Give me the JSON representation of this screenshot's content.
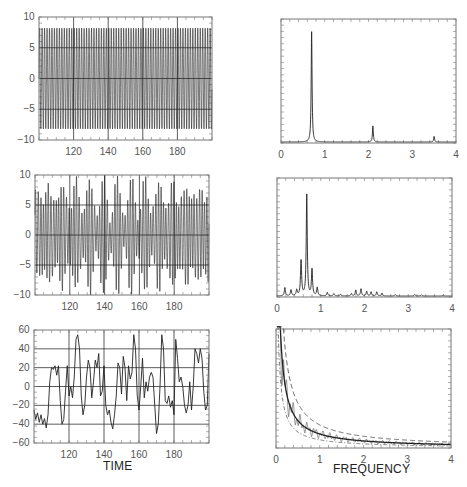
{
  "figure": {
    "xlabel_left": "TIME",
    "xlabel_right": "FREQUENCY",
    "line_color": "#222222",
    "grid_color": "#333333",
    "frame_color": "#777777"
  },
  "chart_data": [
    {
      "id": "ts1",
      "type": "line",
      "title": "",
      "xlabel": "",
      "ylabel": "",
      "box": [
        39,
        17,
        212,
        140
      ],
      "xlim": [
        100,
        200
      ],
      "ylim": [
        -10,
        10
      ],
      "xticks": [
        120,
        140,
        160,
        180
      ],
      "yticks": [
        -10,
        -5,
        0,
        5,
        10
      ],
      "xgrid": [
        120,
        140,
        160,
        180
      ],
      "ygrid": [
        -5,
        0,
        5
      ],
      "signal": {
        "kind": "sine",
        "amplitude": 8.2,
        "freq": 0.7,
        "mod": 0.0
      }
    },
    {
      "id": "spec1",
      "type": "line",
      "title": "",
      "xlabel": "",
      "ylabel": "",
      "box": [
        281,
        19,
        456,
        143
      ],
      "xlim": [
        0,
        4
      ],
      "ylim": [
        0,
        1
      ],
      "xticks": [
        0,
        1,
        2,
        3,
        4
      ],
      "yticks": [],
      "peaks": [
        {
          "f": 0.7,
          "h": 0.89,
          "w": 0.012
        },
        {
          "f": 2.1,
          "h": 0.13,
          "w": 0.012
        },
        {
          "f": 3.5,
          "h": 0.045,
          "w": 0.012
        }
      ]
    },
    {
      "id": "ts2",
      "type": "line",
      "title": "",
      "xlabel": "",
      "ylabel": "",
      "box": [
        35,
        175,
        209,
        295
      ],
      "xlim": [
        100,
        200
      ],
      "ylim": [
        -10,
        10
      ],
      "xticks": [
        120,
        140,
        160,
        180
      ],
      "yticks": [
        -10,
        -5,
        0,
        5,
        10
      ],
      "xgrid": [
        120,
        140,
        160,
        180
      ],
      "ygrid": [
        -5,
        0,
        5
      ],
      "signal": {
        "kind": "multi",
        "amplitude": 9.0
      }
    },
    {
      "id": "spec2",
      "type": "line",
      "title": "",
      "xlabel": "",
      "ylabel": "",
      "box": [
        277,
        178,
        452,
        297
      ],
      "xlim": [
        0,
        4
      ],
      "ylim": [
        0,
        1
      ],
      "xticks": [
        0,
        1,
        2,
        3,
        4
      ],
      "yticks": [],
      "peaks": [
        {
          "f": 0.18,
          "h": 0.07,
          "w": 0.015
        },
        {
          "f": 0.32,
          "h": 0.05,
          "w": 0.015
        },
        {
          "f": 0.45,
          "h": 0.05,
          "w": 0.015
        },
        {
          "f": 0.55,
          "h": 0.3,
          "w": 0.015
        },
        {
          "f": 0.68,
          "h": 0.85,
          "w": 0.014
        },
        {
          "f": 0.8,
          "h": 0.22,
          "w": 0.015
        },
        {
          "f": 0.92,
          "h": 0.07,
          "w": 0.015
        },
        {
          "f": 1.15,
          "h": 0.03,
          "w": 0.015
        },
        {
          "f": 1.3,
          "h": 0.02,
          "w": 0.015
        },
        {
          "f": 1.45,
          "h": 0.015,
          "w": 0.015
        },
        {
          "f": 1.7,
          "h": 0.02,
          "w": 0.015
        },
        {
          "f": 1.8,
          "h": 0.05,
          "w": 0.015
        },
        {
          "f": 1.92,
          "h": 0.06,
          "w": 0.015
        },
        {
          "f": 2.05,
          "h": 0.04,
          "w": 0.015
        },
        {
          "f": 2.15,
          "h": 0.035,
          "w": 0.015
        },
        {
          "f": 2.28,
          "h": 0.035,
          "w": 0.015
        },
        {
          "f": 2.4,
          "h": 0.025,
          "w": 0.015
        },
        {
          "f": 2.7,
          "h": 0.012,
          "w": 0.015
        },
        {
          "f": 3.15,
          "h": 0.012,
          "w": 0.015
        },
        {
          "f": 3.3,
          "h": 0.01,
          "w": 0.015
        },
        {
          "f": 3.8,
          "h": 0.008,
          "w": 0.015
        }
      ]
    },
    {
      "id": "ts3",
      "type": "line",
      "title": "",
      "xlabel": "TIME",
      "ylabel": "",
      "box": [
        34,
        330,
        209,
        443
      ],
      "xlim": [
        100,
        200
      ],
      "ylim": [
        -60,
        60
      ],
      "xticks": [
        120,
        140,
        160,
        180
      ],
      "yticks": [
        -60,
        -40,
        -20,
        0,
        20,
        40,
        60
      ],
      "xgrid": [
        120,
        140,
        160,
        180
      ],
      "ygrid": [
        -40,
        -20,
        0,
        20,
        40
      ],
      "points": [
        [
          100,
          -25
        ],
        [
          101,
          -35
        ],
        [
          102,
          -28
        ],
        [
          103,
          -38
        ],
        [
          104,
          -30
        ],
        [
          105,
          -40
        ],
        [
          106,
          -34
        ],
        [
          107,
          -44
        ],
        [
          108,
          -30
        ],
        [
          109,
          5
        ],
        [
          110,
          20
        ],
        [
          111,
          18
        ],
        [
          112,
          22
        ],
        [
          113,
          12
        ],
        [
          114,
          22
        ],
        [
          115,
          -15
        ],
        [
          116,
          -40
        ],
        [
          117,
          -35
        ],
        [
          118,
          -5
        ],
        [
          119,
          22
        ],
        [
          120,
          -10
        ],
        [
          121,
          0
        ],
        [
          122,
          -12
        ],
        [
          123,
          10
        ],
        [
          124,
          50
        ],
        [
          125,
          55
        ],
        [
          126,
          40
        ],
        [
          127,
          -10
        ],
        [
          128,
          -30
        ],
        [
          129,
          -20
        ],
        [
          130,
          10
        ],
        [
          131,
          28
        ],
        [
          132,
          20
        ],
        [
          133,
          -12
        ],
        [
          134,
          5
        ],
        [
          135,
          28
        ],
        [
          136,
          20
        ],
        [
          137,
          35
        ],
        [
          138,
          -10
        ],
        [
          139,
          -5
        ],
        [
          140,
          22
        ],
        [
          141,
          -20
        ],
        [
          142,
          -30
        ],
        [
          143,
          -25
        ],
        [
          144,
          -38
        ],
        [
          145,
          -45
        ],
        [
          146,
          -30
        ],
        [
          147,
          -10
        ],
        [
          148,
          25
        ],
        [
          149,
          20
        ],
        [
          150,
          -8
        ],
        [
          151,
          32
        ],
        [
          152,
          20
        ],
        [
          153,
          -15
        ],
        [
          154,
          22
        ],
        [
          155,
          8
        ],
        [
          156,
          15
        ],
        [
          157,
          55
        ],
        [
          158,
          40
        ],
        [
          159,
          -10
        ],
        [
          160,
          -25
        ],
        [
          161,
          0
        ],
        [
          162,
          30
        ],
        [
          163,
          -12
        ],
        [
          164,
          5
        ],
        [
          165,
          -5
        ],
        [
          166,
          10
        ],
        [
          167,
          15
        ],
        [
          168,
          10
        ],
        [
          169,
          -20
        ],
        [
          170,
          -50
        ],
        [
          171,
          -40
        ],
        [
          172,
          0
        ],
        [
          173,
          55
        ],
        [
          174,
          40
        ],
        [
          175,
          -15
        ],
        [
          176,
          -18
        ],
        [
          177,
          -10
        ],
        [
          178,
          -22
        ],
        [
          179,
          -15
        ],
        [
          180,
          -30
        ],
        [
          181,
          50
        ],
        [
          182,
          30
        ],
        [
          183,
          5
        ],
        [
          184,
          10
        ],
        [
          185,
          0
        ],
        [
          186,
          -20
        ],
        [
          187,
          -28
        ],
        [
          188,
          -20
        ],
        [
          189,
          5
        ],
        [
          190,
          -25
        ],
        [
          191,
          0
        ],
        [
          192,
          40
        ],
        [
          193,
          35
        ],
        [
          194,
          25
        ],
        [
          195,
          40
        ],
        [
          196,
          30
        ],
        [
          197,
          -5
        ],
        [
          198,
          -25
        ],
        [
          199,
          -20
        ],
        [
          200,
          35
        ],
        [
          201,
          40
        ],
        [
          202,
          20
        ],
        [
          203,
          -10
        ],
        [
          204,
          -25
        ],
        [
          205,
          -20
        ],
        [
          206,
          15
        ],
        [
          207,
          10
        ],
        [
          208,
          -15
        ]
      ]
    },
    {
      "id": "spec3",
      "type": "line",
      "title": "",
      "xlabel": "FREQUENCY",
      "ylabel": "",
      "box": [
        276,
        329,
        451,
        448
      ],
      "xlim": [
        0,
        4
      ],
      "ylim": [
        0,
        1
      ],
      "xticks": [
        0,
        1,
        2,
        3,
        4
      ],
      "yticks": [],
      "series": [
        {
          "name": "spectrum",
          "style": "solid"
        },
        {
          "name": "fit",
          "style": "solid-bold"
        },
        {
          "name": "upper-confidence",
          "style": "dashed"
        },
        {
          "name": "lower-confidence",
          "style": "dashdot"
        }
      ]
    }
  ]
}
